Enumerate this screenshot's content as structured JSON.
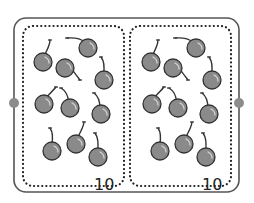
{
  "colors": {
    "frame": "#555555",
    "dots": "#222222",
    "cherry_fill": "#8a8a8a",
    "cherry_outline": "#333333",
    "stem": "#333333",
    "connector_dot": "#8c8c8c"
  },
  "groups": [
    {
      "label": "10",
      "offset_x": 0,
      "cherries": [
        {
          "cx": 43,
          "cy": 62,
          "sx": 50,
          "sy": 40
        },
        {
          "cx": 65,
          "cy": 68,
          "sx": 80,
          "sy": 80
        },
        {
          "cx": 88,
          "cy": 48,
          "sx": 67,
          "sy": 38
        },
        {
          "cx": 104,
          "cy": 80,
          "sx": 101,
          "sy": 57
        },
        {
          "cx": 44,
          "cy": 104,
          "sx": 56,
          "sy": 87
        },
        {
          "cx": 70,
          "cy": 108,
          "sx": 61,
          "sy": 88
        },
        {
          "cx": 101,
          "cy": 114,
          "sx": 94,
          "sy": 93
        },
        {
          "cx": 52,
          "cy": 151,
          "sx": 50,
          "sy": 128
        },
        {
          "cx": 76,
          "cy": 144,
          "sx": 84,
          "sy": 122
        },
        {
          "cx": 98,
          "cy": 157,
          "sx": 95,
          "sy": 133
        }
      ]
    },
    {
      "label": "10",
      "offset_x": 108,
      "cherries": [
        {
          "cx": 43,
          "cy": 62,
          "sx": 50,
          "sy": 40
        },
        {
          "cx": 65,
          "cy": 68,
          "sx": 80,
          "sy": 80
        },
        {
          "cx": 88,
          "cy": 48,
          "sx": 67,
          "sy": 38
        },
        {
          "cx": 104,
          "cy": 80,
          "sx": 101,
          "sy": 57
        },
        {
          "cx": 44,
          "cy": 104,
          "sx": 56,
          "sy": 87
        },
        {
          "cx": 70,
          "cy": 108,
          "sx": 61,
          "sy": 88
        },
        {
          "cx": 101,
          "cy": 114,
          "sx": 94,
          "sy": 93
        },
        {
          "cx": 52,
          "cy": 151,
          "sx": 50,
          "sy": 128
        },
        {
          "cx": 76,
          "cy": 144,
          "sx": 84,
          "sy": 122
        },
        {
          "cx": 98,
          "cy": 157,
          "sx": 95,
          "sy": 133
        }
      ]
    }
  ]
}
